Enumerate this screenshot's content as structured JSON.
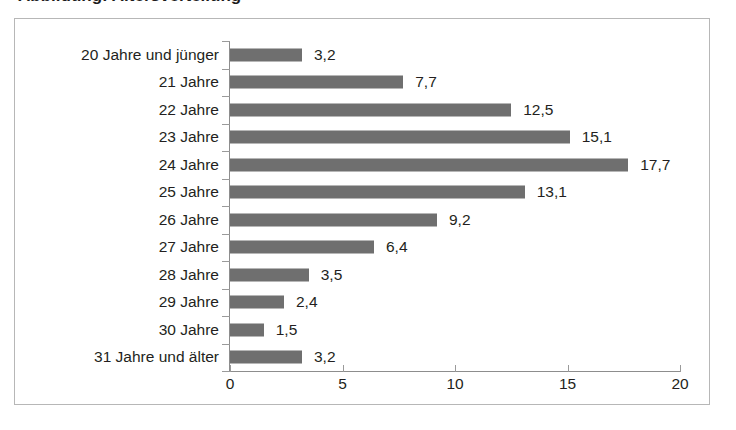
{
  "title_fragment": "Abbildung: Altersverteilung",
  "colors": {
    "bar": "#6f6f6f",
    "text": "#231f20",
    "axis": "#8d8d8d",
    "frame": "#b7b7b7",
    "background": "#ffffff"
  },
  "chart_data": {
    "type": "bar",
    "orientation": "horizontal",
    "title": "",
    "xlabel": "",
    "ylabel": "",
    "categories": [
      "20 Jahre und jünger",
      "21 Jahre",
      "22 Jahre",
      "23 Jahre",
      "24 Jahre",
      "25 Jahre",
      "26 Jahre",
      "27 Jahre",
      "28 Jahre",
      "29 Jahre",
      "30 Jahre",
      "31 Jahre und älter"
    ],
    "values": [
      3.2,
      7.7,
      12.5,
      15.1,
      17.7,
      13.1,
      9.2,
      6.4,
      3.5,
      2.4,
      1.5,
      3.2
    ],
    "value_labels": [
      "3,2",
      "7,7",
      "12,5",
      "15,1",
      "17,7",
      "13,1",
      "9,2",
      "6,4",
      "3,5",
      "2,4",
      "1,5",
      "3,2"
    ],
    "xlim": [
      0,
      20
    ],
    "xticks": [
      0,
      5,
      10,
      15,
      20
    ],
    "xtick_labels": [
      "0",
      "5",
      "10",
      "15",
      "20"
    ],
    "grid": false,
    "legend": false,
    "decimal_separator": ","
  }
}
